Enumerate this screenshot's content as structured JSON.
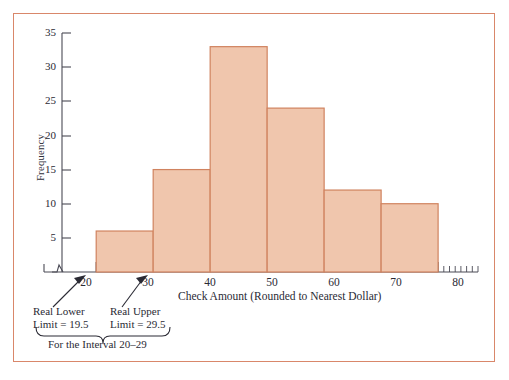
{
  "figure": {
    "border_color": "#d9876a",
    "background": "#ffffff"
  },
  "chart_data": {
    "type": "bar",
    "title": "",
    "xlabel": "Check Amount (Rounded to Nearest Dollar)",
    "ylabel": "Frequency",
    "categories": [
      "20-30",
      "30-40",
      "40-50",
      "50-60",
      "60-70",
      "70-80"
    ],
    "bin_edges": [
      20,
      30,
      40,
      50,
      60,
      70,
      80
    ],
    "values": [
      6,
      15,
      33,
      24,
      12,
      10
    ],
    "xlim": [
      14,
      87
    ],
    "ylim": [
      0,
      35
    ],
    "yticks": [
      5,
      10,
      15,
      20,
      25,
      30,
      35
    ],
    "ytick_labels": [
      "5",
      "10",
      "15",
      "20",
      "25",
      "30",
      "35"
    ],
    "xticks": [
      20,
      30,
      40,
      50,
      60,
      70,
      80
    ],
    "xtick_labels": [
      "20",
      "30",
      "40",
      "50",
      "60",
      "70",
      "80"
    ],
    "minor_tick_step": 1,
    "grid": false,
    "legend": null,
    "bar_fill_color": "#f0c6ad",
    "bar_edge_color": "#d0835f",
    "axis_color": "#4a4a55",
    "axis_break": true,
    "annotations": [
      {
        "name": "real-lower-limit",
        "line1": "Real Lower",
        "line2": "Limit = 19.5",
        "points_to": 20
      },
      {
        "name": "real-upper-limit",
        "line1": "Real Upper",
        "line2": "Limit = 29.5",
        "points_to": 30
      },
      {
        "name": "interval-brace",
        "text": "For the Interval 20–29",
        "spans": [
          20,
          30
        ]
      }
    ]
  }
}
